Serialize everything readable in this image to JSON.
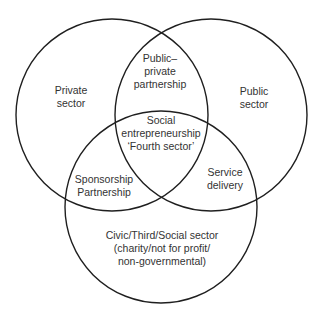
{
  "diagram": {
    "type": "venn",
    "colors": {
      "stroke": "#1f1f1f",
      "text": "#333333",
      "background": "#ffffff"
    },
    "circles": [
      {
        "name": "private-sector",
        "cx": 112,
        "cy": 115,
        "r": 96
      },
      {
        "name": "public-sector",
        "cx": 211,
        "cy": 115,
        "r": 96
      },
      {
        "name": "civic-sector",
        "cx": 161,
        "cy": 207,
        "r": 96
      }
    ],
    "regions": {
      "private": {
        "lines": [
          "Private",
          "sector"
        ]
      },
      "public": {
        "lines": [
          "Public",
          "sector"
        ]
      },
      "public_private": {
        "lines": [
          "Public–",
          "private",
          "partnership"
        ]
      },
      "center": {
        "lines": [
          "Social",
          "entrepreneurship",
          "‘Fourth sector’"
        ]
      },
      "sponsorship": {
        "lines": [
          "Sponsorship",
          "Partnership"
        ]
      },
      "service": {
        "lines": [
          "Service",
          "delivery"
        ]
      },
      "civic": {
        "lines": [
          "Civic/Third/Social sector",
          "(charity/not for profit/",
          "non-governmental)"
        ]
      }
    }
  }
}
